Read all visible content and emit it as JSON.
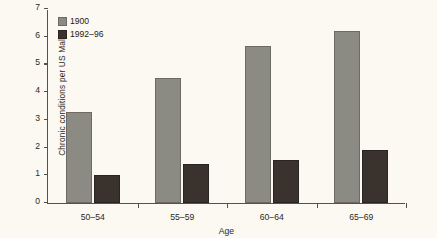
{
  "chart_data": {
    "type": "bar",
    "title": "",
    "subtitle": "",
    "xlabel": "Age",
    "ylabel": "Chronic conditions per US Male",
    "categories": [
      "50–54",
      "55–59",
      "60–64",
      "65–69"
    ],
    "series": [
      {
        "name": "1900",
        "values": [
          3.3,
          4.5,
          5.65,
          6.2
        ],
        "color": "#8c8b83"
      },
      {
        "name": "1992–96",
        "values": [
          1.0,
          1.4,
          1.55,
          1.9
        ],
        "color": "#3a332d"
      }
    ],
    "ylim": [
      0,
      7
    ],
    "yticks": [
      0,
      1,
      2,
      3,
      4,
      5,
      6,
      7
    ],
    "ytick_labels": [
      "0",
      "1",
      "2",
      "3",
      "4",
      "5",
      "6",
      "7"
    ],
    "grid": false,
    "legend_position": "top-left",
    "background_color": "#fbf9f1",
    "axis_color": "#55524c"
  },
  "legend": {
    "entries": [
      {
        "label": "1900"
      },
      {
        "label": "1992–96"
      }
    ]
  },
  "axes": {
    "x_title": "Age",
    "y_title": "Chronic conditions per US Male"
  }
}
